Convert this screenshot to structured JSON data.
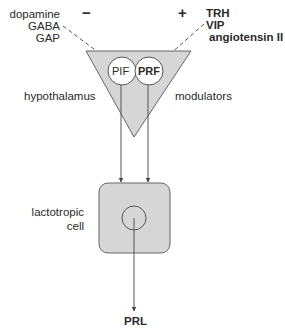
{
  "inhibitors": {
    "sign": "−",
    "items": [
      "dopamine",
      "GABA",
      "GAP"
    ]
  },
  "stimulators": {
    "sign": "+",
    "items": [
      "TRH",
      "VIP",
      "angiotensin II"
    ]
  },
  "hypothalamus": {
    "label": "hypothalamus",
    "pif_label": "PIF",
    "prf_label": "PRF"
  },
  "modulators_label": "modulators",
  "cell": {
    "label_line1": "lactotropic",
    "label_line2": "cell"
  },
  "output_label": "PRL",
  "colors": {
    "fill": "#d6d6d6",
    "stroke": "#555555",
    "text": "#2a2a2a"
  }
}
